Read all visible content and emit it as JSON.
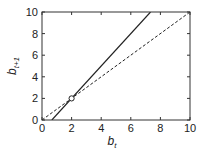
{
  "chart_data": {
    "type": "line",
    "title": "",
    "xlabel": "b_t",
    "ylabel": "b_{t+1}",
    "xlabel_main": "b",
    "xlabel_sub": "t",
    "ylabel_main": "b",
    "ylabel_sub": "t+1",
    "xlim": [
      0,
      10
    ],
    "ylim": [
      0,
      10
    ],
    "xticks": [
      0,
      2,
      4,
      6,
      8,
      10
    ],
    "yticks": [
      0,
      2,
      4,
      6,
      8,
      10
    ],
    "grid": false,
    "legend": null,
    "series": [
      {
        "name": "map",
        "style": "solid",
        "x": [
          0.667,
          7.333
        ],
        "y": [
          0,
          10
        ]
      },
      {
        "name": "identity",
        "style": "dashed",
        "x": [
          0,
          10
        ],
        "y": [
          0,
          10
        ]
      }
    ],
    "annotations": [
      {
        "type": "open-circle",
        "label": "fixed point",
        "x": 2,
        "y": 2
      }
    ]
  }
}
